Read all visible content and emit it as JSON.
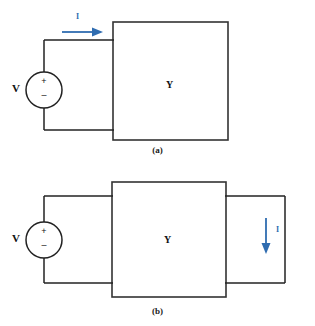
{
  "figure": {
    "colors": {
      "wire": "#222222",
      "box_stroke": "#333333",
      "current_arrow": "#2f6cb0",
      "text": "#111111"
    }
  },
  "diagrams": [
    {
      "id": "a",
      "caption": "(a)",
      "source": {
        "label": "V",
        "plus": "+",
        "minus": "–",
        "symbol": "voltage-source-circle"
      },
      "network": {
        "label": "Y",
        "shape": "rectangle-black-box"
      },
      "current": {
        "label": "I",
        "direction": "right",
        "position": "top-left-wire"
      }
    },
    {
      "id": "b",
      "caption": "(b)",
      "source": {
        "label": "V",
        "plus": "+",
        "minus": "–",
        "symbol": "voltage-source-circle"
      },
      "network": {
        "label": "Y",
        "shape": "rectangle-black-box"
      },
      "current": {
        "label": "I",
        "direction": "down",
        "position": "right-loop-wire"
      }
    }
  ]
}
